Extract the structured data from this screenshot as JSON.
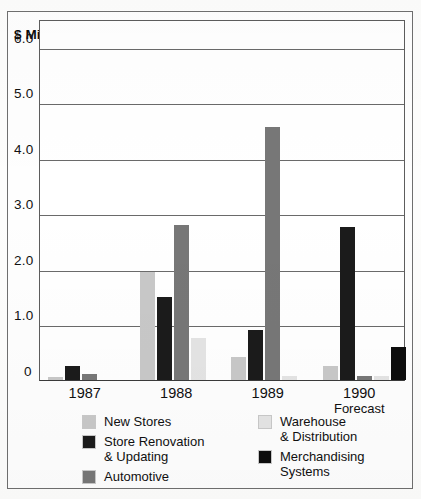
{
  "axis_title": "$ Millions",
  "chart_data": {
    "type": "bar",
    "title": "",
    "xlabel": "",
    "ylabel": "$ Millions",
    "ylim": [
      0,
      6.5
    ],
    "yticks": [
      "0",
      "1.0",
      "2.0",
      "3.0",
      "4.0",
      "5.0",
      "6.0"
    ],
    "ytick_values": [
      0,
      1.0,
      2.0,
      3.0,
      4.0,
      5.0,
      6.0
    ],
    "grid": true,
    "legend_position": "below",
    "categories": [
      "1987",
      "1988",
      "1989",
      "1990"
    ],
    "category_sublabels": [
      "",
      "",
      "",
      "Forecast"
    ],
    "series": [
      {
        "name": "New Stores",
        "color": "#c8c8c8",
        "values": [
          0.05,
          1.95,
          0.42,
          0.25
        ]
      },
      {
        "name": "Store Renovation\n& Updating",
        "color": "#1b1b1b",
        "values": [
          0.25,
          1.5,
          0.9,
          2.75
        ]
      },
      {
        "name": "Automotive",
        "color": "#777777",
        "values": [
          0.1,
          2.8,
          4.55,
          0.07
        ]
      },
      {
        "name": "Warehouse\n& Distribution",
        "color": "#e4e4e4",
        "values": [
          0.0,
          0.75,
          0.07,
          0.07
        ]
      },
      {
        "name": "Merchandising\nSystems",
        "color": "#0d0d0d",
        "values": [
          0.0,
          0.0,
          0.0,
          0.6
        ]
      }
    ]
  },
  "legend": {
    "left_column": [
      {
        "label": "New Stores",
        "color": "#c8c8c8"
      },
      {
        "label": "Store Renovation\n& Updating",
        "color": "#1b1b1b"
      },
      {
        "label": "Automotive",
        "color": "#777777"
      }
    ],
    "right_column": [
      {
        "label": "Warehouse\n& Distribution",
        "color": "#e4e4e4"
      },
      {
        "label": "Merchandising\nSystems",
        "color": "#0d0d0d"
      }
    ]
  }
}
